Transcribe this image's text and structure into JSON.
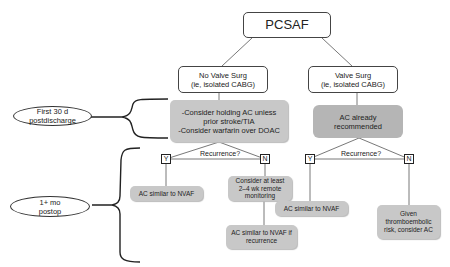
{
  "title": "PCSAF",
  "branches": {
    "no_valve": {
      "label_line1": "No Valve Surg",
      "label_line2": "(ie, isolated CABG)",
      "recommendation_lines": [
        "-Consider holding AC unless",
        "prior stroke/TIA",
        "-Consider warfarin over DOAC"
      ],
      "decision": "Recurrence?",
      "yes_label": "Y",
      "no_label": "N",
      "yes_outcome": "AC similar to NVAF",
      "no_outcome_lines": [
        "Consider at least",
        "2–4 wk remote",
        "monitoring"
      ],
      "no_followup_lines": [
        "AC similar to NVAF if",
        "recurrence"
      ]
    },
    "valve": {
      "label_line1": "Valve Surg",
      "label_line2": "(ie, isolated CABG)",
      "recommendation_lines": [
        "AC already",
        "recommended"
      ],
      "decision": "Recurrence?",
      "yes_label": "Y",
      "no_label": "N",
      "yes_outcome": "AC similar to NVAF",
      "no_outcome_lines": [
        "Given",
        "thromboembolic",
        "risk, consider AC"
      ]
    }
  },
  "time_periods": [
    {
      "line1": "First 30 d",
      "line2": "postdischarge"
    },
    {
      "line1": "1+ mo",
      "line2": "postop"
    }
  ],
  "colors": {
    "box_gray": "#c8c8c8",
    "box_dark_gray": "#b5b5b5",
    "line": "#555555",
    "brace": "#222222"
  }
}
